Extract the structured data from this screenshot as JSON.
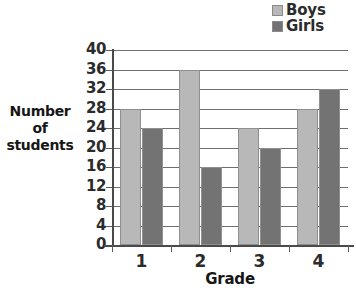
{
  "chart_data": {
    "type": "bar",
    "title": "",
    "xlabel": "Grade",
    "ylabel": "Number of students",
    "ylabel_lines": [
      "Number",
      "of",
      "students"
    ],
    "categories": [
      "1",
      "2",
      "3",
      "4"
    ],
    "series": [
      {
        "name": "Boys",
        "values": [
          28,
          36,
          24,
          28
        ],
        "color": "#b8b8b8"
      },
      {
        "name": "Girls",
        "values": [
          24,
          16,
          20,
          32
        ],
        "color": "#737373"
      }
    ],
    "ylim": [
      0,
      40
    ],
    "ytick_step": 4,
    "yticks": [
      40,
      36,
      32,
      28,
      24,
      20,
      16,
      12,
      8,
      4,
      0
    ],
    "grid": true,
    "legend_position": "top-right"
  },
  "legend": {
    "items": [
      {
        "label": "Boys",
        "color": "#b8b8b8"
      },
      {
        "label": "Girls",
        "color": "#737373"
      }
    ]
  },
  "axes": {
    "y_title_lines": [
      "Number",
      "of",
      "students"
    ],
    "x_title": "Grade"
  }
}
